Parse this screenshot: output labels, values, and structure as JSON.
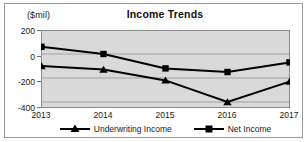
{
  "figure": {
    "unit_label": "($mil)",
    "title": "Income Trends"
  },
  "axis": {
    "yticks": [
      "200",
      "0",
      "-200",
      "-400"
    ],
    "xticks": [
      "2013",
      "2014",
      "2015",
      "2016",
      "2017"
    ]
  },
  "legend": {
    "items": [
      {
        "label": "Underwriting Income",
        "marker": "triangle-marker",
        "color": "#000000"
      },
      {
        "label": "Net Income",
        "marker": "square-marker",
        "color": "#000000"
      }
    ]
  },
  "chart_data": {
    "type": "line",
    "title": "Income Trends",
    "xlabel": "",
    "ylabel": "($mil)",
    "categories": [
      "2013",
      "2014",
      "2015",
      "2016",
      "2017"
    ],
    "x": [
      2013,
      2014,
      2015,
      2016,
      2017
    ],
    "series": [
      {
        "name": "Underwriting Income",
        "marker": "triangle",
        "color": "#000000",
        "values": [
          -100,
          -130,
          -220,
          -400,
          -230
        ]
      },
      {
        "name": "Net Income",
        "marker": "square",
        "color": "#000000",
        "values": [
          60,
          0,
          -120,
          -150,
          -70
        ]
      }
    ],
    "ylim": [
      -450,
      200
    ],
    "yticks": [
      200,
      0,
      -200,
      -400
    ],
    "grid": true,
    "grid_axis": "y",
    "legend_position": "bottom",
    "plot_background": "#d9d9d9"
  }
}
